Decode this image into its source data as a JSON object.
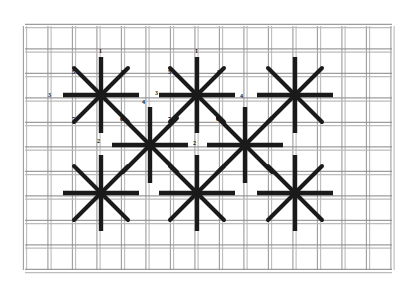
{
  "figure": {
    "background_color": "#ffffff",
    "stitch_color": "#1a1a1a",
    "canvas_thread_color": "#b9b9b9",
    "canvas_thread_shadow": "#8d8d8d",
    "label_color": "#111111"
  },
  "canvas_mesh": {
    "name": "needlepoint-canvas-mesh",
    "left": 25,
    "top": 26,
    "right": 392,
    "bottom": 270,
    "cell_size": 24.5,
    "thread_pair_gap": 3.2,
    "thread_width": 1.1,
    "columns": 15,
    "rows": 10
  },
  "stitches": [
    {
      "id": "star-1",
      "name": "star-stitch-top-left",
      "cx": 101,
      "cy": 95,
      "arm_long": 38,
      "arm_short": 27,
      "labeled": true
    },
    {
      "id": "star-2",
      "name": "star-stitch-top-center",
      "cx": 197,
      "cy": 95,
      "arm_long": 38,
      "arm_short": 27,
      "labeled": true
    },
    {
      "id": "star-3",
      "name": "star-stitch-top-right",
      "cx": 295,
      "cy": 95,
      "arm_long": 38,
      "arm_short": 27,
      "labeled": false
    },
    {
      "id": "star-4",
      "name": "star-stitch-middle-left",
      "cx": 150,
      "cy": 145,
      "arm_long": 38,
      "arm_short": 27,
      "labeled": false
    },
    {
      "id": "star-5",
      "name": "star-stitch-middle-right",
      "cx": 245,
      "cy": 145,
      "arm_long": 38,
      "arm_short": 27,
      "labeled": false
    },
    {
      "id": "star-6",
      "name": "star-stitch-bottom-left",
      "cx": 101,
      "cy": 193,
      "arm_long": 38,
      "arm_short": 27,
      "labeled": false
    },
    {
      "id": "star-7",
      "name": "star-stitch-bottom-center",
      "cx": 197,
      "cy": 193,
      "arm_long": 38,
      "arm_short": 27,
      "labeled": false
    },
    {
      "id": "star-8",
      "name": "star-stitch-bottom-right",
      "cx": 295,
      "cy": 193,
      "arm_long": 38,
      "arm_short": 27,
      "labeled": false
    }
  ],
  "sequence_labels": [
    {
      "star": "star-1",
      "text": "1",
      "x": 99,
      "y": 48,
      "point": "top"
    },
    {
      "star": "star-1",
      "text": "5",
      "x": 72,
      "y": 69,
      "point": "upper-left"
    },
    {
      "star": "star-1",
      "text": "8",
      "x": 121,
      "y": 69,
      "point": "upper-right"
    },
    {
      "star": "star-1",
      "text": "3",
      "x": 48,
      "y": 92,
      "point": "left"
    },
    {
      "star": "star-1",
      "text": "4",
      "x": 142,
      "y": 99,
      "point": "right"
    },
    {
      "star": "star-1",
      "text": "7",
      "x": 72,
      "y": 116,
      "point": "lower-left"
    },
    {
      "star": "star-1",
      "text": "6",
      "x": 120,
      "y": 116,
      "point": "lower-right"
    },
    {
      "star": "star-1",
      "text": "2",
      "x": 97,
      "y": 138,
      "point": "bottom"
    },
    {
      "star": "star-2",
      "text": "1",
      "x": 195,
      "y": 48,
      "point": "top"
    },
    {
      "star": "star-2",
      "text": "5",
      "x": 168,
      "y": 69,
      "point": "upper-left"
    },
    {
      "star": "star-2",
      "text": "8",
      "x": 217,
      "y": 69,
      "point": "upper-right"
    },
    {
      "star": "star-2",
      "text": "3",
      "x": 155,
      "y": 90,
      "point": "left"
    },
    {
      "star": "star-2",
      "text": "4",
      "x": 240,
      "y": 93,
      "point": "right"
    },
    {
      "star": "star-2",
      "text": "7",
      "x": 168,
      "y": 116,
      "point": "lower-left"
    },
    {
      "star": "star-2",
      "text": "6",
      "x": 216,
      "y": 116,
      "point": "lower-right"
    },
    {
      "star": "star-2",
      "text": "2",
      "x": 193,
      "y": 140,
      "point": "bottom"
    }
  ]
}
